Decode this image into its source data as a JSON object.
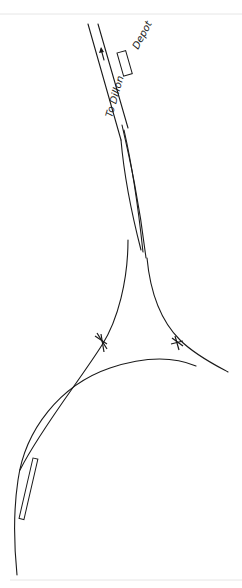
{
  "diagram": {
    "type": "railway-wye-track-plan",
    "labels": {
      "direction": "To Dillon",
      "building": "Depot"
    },
    "elements": [
      {
        "name": "main-line",
        "kind": "track"
      },
      {
        "name": "passing-siding",
        "kind": "track"
      },
      {
        "name": "wye-west-leg",
        "kind": "track"
      },
      {
        "name": "wye-east-leg",
        "kind": "track"
      },
      {
        "name": "tail-curve",
        "kind": "track"
      },
      {
        "name": "west-switch-stand",
        "kind": "switch"
      },
      {
        "name": "east-switch-stand",
        "kind": "switch"
      },
      {
        "name": "depot-building",
        "kind": "structure"
      },
      {
        "name": "platform",
        "kind": "structure"
      }
    ],
    "colors": {
      "ink": "#1a1a1a",
      "paper": "#ffffff"
    }
  }
}
